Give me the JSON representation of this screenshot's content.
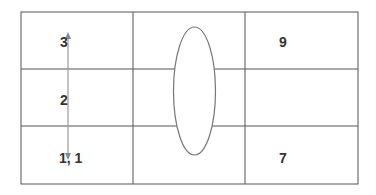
{
  "diagram": {
    "grid": {
      "rows": 3,
      "cols": 3,
      "line_color": "#555555"
    },
    "cells": [
      {
        "row": 0,
        "col": 0,
        "label": "3"
      },
      {
        "row": 1,
        "col": 0,
        "label": "2"
      },
      {
        "row": 2,
        "col": 0,
        "label": "1, 1"
      },
      {
        "row": 0,
        "col": 2,
        "label": "9"
      },
      {
        "row": 2,
        "col": 2,
        "label": "7"
      }
    ],
    "shapes": {
      "ellipse": {
        "color": "#777777"
      },
      "arrow": {
        "color": "#999999",
        "direction": "bidirectional-vertical"
      }
    }
  }
}
